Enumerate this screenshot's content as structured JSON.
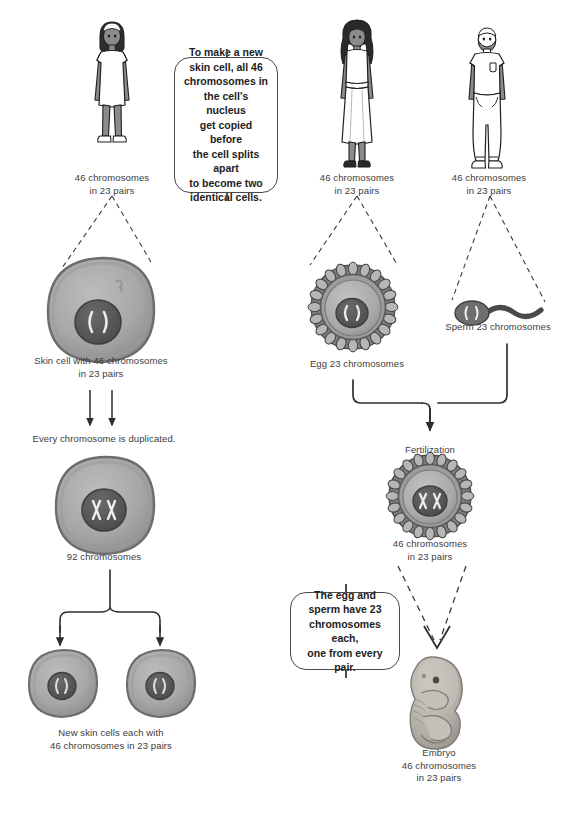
{
  "diagram": {
    "colors": {
      "ink": "#3c3c3c",
      "callout_text": "#1d1d1d",
      "callout_border": "#4a4a4a",
      "cell_body": "#a9a9a9",
      "cell_body_dark": "#8e8e8e",
      "cell_rim": "#6f6f6f",
      "nucleus": "#5c5c5c",
      "nucleus_dark": "#4a4a4a",
      "chromosome": "#e8e8e8",
      "figure_outline": "#1f1f1f",
      "figure_limb": "#8b8b8b",
      "figure_garment": "#ffffff",
      "hair": "#2a2a2a",
      "embryo": "#b5b1ab",
      "background": "#ffffff"
    }
  },
  "left_column": {
    "person_label": "46 chromosomes\nin 23 pairs",
    "skin_cell_label": "Skin cell with 46 chromosomes\nin 23 pairs",
    "duplication_label": "Every chromosome is duplicated.",
    "duplicated_cell_label": "92 chromosomes",
    "daughter_cells_label": "New skin cells each with\n46 chromosomes in 23 pairs"
  },
  "right_column": {
    "mother_label": "46 chromosomes\nin 23 pairs",
    "father_label": "46 chromosomes\nin 23 pairs",
    "egg_label": "Egg 23 chromosomes",
    "sperm_label": "Sperm 23 chromosomes",
    "fertilization_label": "Fertilization",
    "zygote_label": "46 chromosomes\nin 23 pairs",
    "embryo_label": "Embryo\n46 chromosomes\nin 23 pairs"
  },
  "callouts": {
    "mitosis": "To make a new\nskin cell, all 46\nchromosomes in\nthe cell's nucleus\nget copied before\nthe cell splits apart\nto become two\nidentical cells.",
    "meiosis": "The egg and\nsperm have 23\nchromosomes each,\none from every pair."
  }
}
